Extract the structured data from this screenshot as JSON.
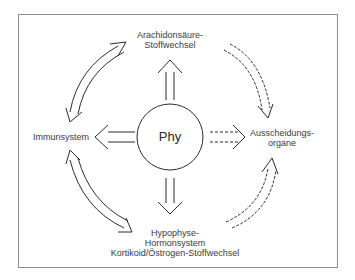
{
  "diagram": {
    "center": {
      "label": "Phy"
    },
    "nodes": {
      "top": {
        "line1": "Arachidonsäure-",
        "line2": "Stoffwechsel"
      },
      "left": {
        "line1": "Immunsystem"
      },
      "right": {
        "line1": "Ausscheidungs-",
        "line2": "organe"
      },
      "bottom": {
        "line1": "Hypophyse-",
        "line2": "Hormonsystem",
        "line3": "Kortikoid/Östrogen-Stoffwechsel"
      }
    },
    "edges": [
      {
        "from": "Phy",
        "to": "Arachidonsäure-Stoffwechsel",
        "style": "solid-double"
      },
      {
        "from": "Phy",
        "to": "Immunsystem",
        "style": "solid-double"
      },
      {
        "from": "Phy",
        "to": "Ausscheidungsorgane",
        "style": "dashed-double"
      },
      {
        "from": "Phy",
        "to": "Hypophyse-Hormonsystem",
        "style": "solid-double"
      },
      {
        "from": "Arachidonsäure-Stoffwechsel",
        "to": "Immunsystem",
        "style": "solid-double-headed-arc"
      },
      {
        "from": "Immunsystem",
        "to": "Hypophyse-Hormonsystem",
        "style": "solid-double-headed-arc"
      },
      {
        "from": "Arachidonsäure-Stoffwechsel",
        "to": "Ausscheidungsorgane",
        "style": "dashed-arc"
      },
      {
        "from": "Hypophyse-Hormonsystem",
        "to": "Ausscheidungsorgane",
        "style": "dashed-arc"
      }
    ],
    "colors": {
      "line": "#2b2b2b",
      "frame": "#8c8c8c",
      "text": "#3a3a3a"
    }
  }
}
